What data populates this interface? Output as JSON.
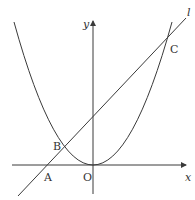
{
  "diagram": {
    "type": "coordinate-graph",
    "colors": {
      "stroke": "#3a3a3a",
      "text": "#333333",
      "background": "#ffffff"
    },
    "axes": {
      "x_label": "x",
      "y_label": "y",
      "origin_label": "O"
    },
    "curves": [
      {
        "name": "parabola",
        "vertex": "O"
      },
      {
        "name": "line",
        "label": "l"
      }
    ],
    "points": {
      "A": "A",
      "B": "B",
      "C": "C"
    },
    "line_label": "l"
  }
}
